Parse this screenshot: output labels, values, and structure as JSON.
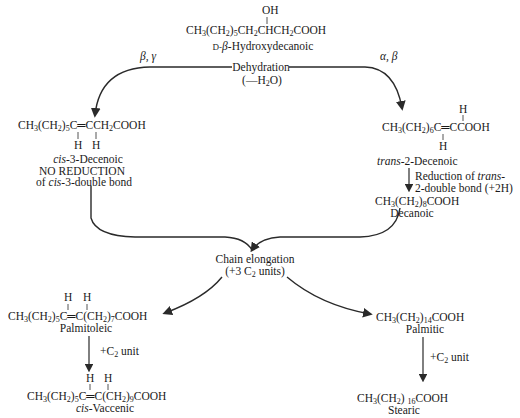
{
  "nodes": {
    "hydroxy": {
      "oh": "OH",
      "formula_a": "CH",
      "formula_b": "3",
      "formula_c": "(CH",
      "formula_d": "2",
      "formula_e": ")",
      "formula_f": "5",
      "formula_g": "CH",
      "formula_h": "2",
      "formula_i": "CHCH",
      "formula_j": "2",
      "formula_k": "COOH",
      "name_prefix": "D-",
      "name_beta": "β",
      "name_rest": "-Hydroxydecanoic"
    },
    "dehydration": {
      "label": "Dehydration",
      "sub_a": "(—H",
      "sub_b": "2",
      "sub_c": "O)"
    },
    "branch_left_label": "β, γ",
    "branch_right_label": "α, β",
    "cis3": {
      "formula_a": "CH",
      "formula_b": "3",
      "formula_c": "(CH",
      "formula_d": "2",
      "formula_e": ")",
      "formula_f": "5",
      "formula_g": "C═CCH",
      "formula_h": "2",
      "formula_i": "COOH",
      "h1": "H",
      "h2": "H",
      "name_italic": "cis",
      "name_rest": "-3-Decenoic",
      "note1": "NO REDUCTION",
      "note2_a": "of ",
      "note2_italic": "cis",
      "note2_b": "-3-double bond"
    },
    "trans2": {
      "formula_a": "CH",
      "formula_b": "3",
      "formula_c": "(CH",
      "formula_d": "2",
      "formula_e": ")",
      "formula_f": "6",
      "formula_g": "C═CCOOH",
      "h_top": "H",
      "h_bottom": "H",
      "name_italic": "trans",
      "name_rest": "-2-Decenoic",
      "reduction1_a": "Reduction of ",
      "reduction1_italic": "trans",
      "reduction1_b": "-",
      "reduction2": "2-double bond (+2H)"
    },
    "decanoic": {
      "formula_a": "CH",
      "formula_b": "3",
      "formula_c": "(CH",
      "formula_d": "2",
      "formula_e": ")",
      "formula_f": "8",
      "formula_g": "COOH",
      "name": "Decanoic"
    },
    "elongation": {
      "label": "Chain elongation",
      "sub_a": "(+3 C",
      "sub_b": "2",
      "sub_c": " units)"
    },
    "palmitoleic": {
      "formula_a": "CH",
      "formula_b": "3",
      "formula_c": "(CH",
      "formula_d": "2",
      "formula_e": ")",
      "formula_f": "5",
      "formula_g": "C═C(CH",
      "formula_h": "2",
      "formula_i": ")",
      "formula_j": "7",
      "formula_k": "COOH",
      "h1": "H",
      "h2": "H",
      "name": "Palmitoleic"
    },
    "c2_left": {
      "a": "+C",
      "b": "2",
      "c": " unit"
    },
    "vaccenic": {
      "formula_a": "CH",
      "formula_b": "3",
      "formula_c": "(CH",
      "formula_d": "2",
      "formula_e": ")",
      "formula_f": "5",
      "formula_g": "C═C(CH",
      "formula_h": "2",
      "formula_i": ")",
      "formula_j": "9",
      "formula_k": "COOH",
      "h1": "H",
      "h2": "H",
      "name_italic": "cis",
      "name_rest": "-Vaccenic"
    },
    "palmitic": {
      "formula_a": "CH",
      "formula_b": "3",
      "formula_c": "(CH",
      "formula_d": "2",
      "formula_e": ")",
      "formula_f": "14",
      "formula_g": "COOH",
      "name": "Palmitic"
    },
    "c2_right": {
      "a": "+C",
      "b": "2",
      "c": " unit"
    },
    "stearic": {
      "formula_a": "CH",
      "formula_b": "3",
      "formula_c": "(CH",
      "formula_d": "2",
      "formula_e": ") ",
      "formula_f": "16",
      "formula_g": "COOH",
      "name": "Stearic"
    }
  },
  "colors": {
    "ink": "#1a1a1a",
    "line": "#2a2a2a",
    "background": "#ffffff"
  }
}
